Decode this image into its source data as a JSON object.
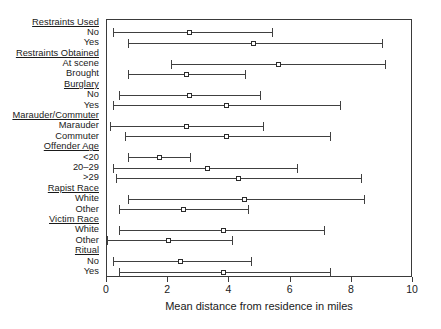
{
  "chart_data": {
    "type": "bar",
    "subtype": "dot-and-whisker-interval-plot",
    "title": "",
    "xlabel": "Mean distance from residence in miles",
    "ylabel": "",
    "xlim": [
      0,
      10
    ],
    "ylim": null,
    "grid": false,
    "legend": null,
    "xticks": [
      0,
      2,
      4,
      6,
      8,
      10
    ],
    "xticklabels": [
      "0",
      "2",
      "4",
      "6",
      "8",
      "10"
    ],
    "groups": [
      {
        "header": "Restraints Used",
        "rows": [
          {
            "label": "No",
            "mean": 2.7,
            "low": 0.2,
            "high": 5.4
          },
          {
            "label": "Yes",
            "mean": 4.8,
            "low": 0.7,
            "high": 9.0
          }
        ]
      },
      {
        "header": "Restraints Obtained",
        "rows": [
          {
            "label": "At scene",
            "mean": 5.6,
            "low": 2.1,
            "high": 9.1
          },
          {
            "label": "Brought",
            "mean": 2.6,
            "low": 0.7,
            "high": 4.5
          }
        ]
      },
      {
        "header": "Burglary",
        "rows": [
          {
            "label": "No",
            "mean": 2.7,
            "low": 0.4,
            "high": 5.0
          },
          {
            "label": "Yes",
            "mean": 3.9,
            "low": 0.2,
            "high": 7.6
          }
        ]
      },
      {
        "header": "Marauder/Commuter",
        "rows": [
          {
            "label": "Marauder",
            "mean": 2.6,
            "low": 0.1,
            "high": 5.1
          },
          {
            "label": "Commuter",
            "mean": 3.9,
            "low": 0.6,
            "high": 7.3
          }
        ]
      },
      {
        "header": "Offender Age",
        "rows": [
          {
            "label": "<20",
            "mean": 1.7,
            "low": 0.7,
            "high": 2.7
          },
          {
            "label": "20–29",
            "mean": 3.3,
            "low": 0.2,
            "high": 6.2
          },
          {
            "label": ">29",
            "mean": 4.3,
            "low": 0.3,
            "high": 8.3
          }
        ]
      },
      {
        "header": "Rapist Race",
        "rows": [
          {
            "label": "White",
            "mean": 4.5,
            "low": 0.7,
            "high": 8.4
          },
          {
            "label": "Other",
            "mean": 2.5,
            "low": 0.4,
            "high": 4.6
          }
        ]
      },
      {
        "header": "Victim Race",
        "rows": [
          {
            "label": "White",
            "mean": 3.8,
            "low": 0.4,
            "high": 7.1
          },
          {
            "label": "Other",
            "mean": 2.0,
            "low": 0.0,
            "high": 4.1
          }
        ]
      },
      {
        "header": "Ritual",
        "rows": [
          {
            "label": "No",
            "mean": 2.4,
            "low": 0.2,
            "high": 4.7
          },
          {
            "label": "Yes",
            "mean": 3.8,
            "low": 0.4,
            "high": 7.3
          }
        ]
      }
    ],
    "colors": {
      "line": "#404040",
      "marker_edge": "#2b2b2b",
      "marker_fill": "#ffffff",
      "frame": "#3a3a3a",
      "text": "#1a1a1a",
      "background": "#ffffff"
    }
  }
}
